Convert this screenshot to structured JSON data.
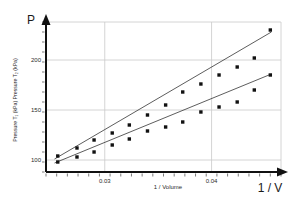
{
  "chart_data": {
    "type": "scatter",
    "title": "",
    "xlabel": "1 / Volume",
    "ylabel": "Pressure T₁ (kPa)   Pressure T₂ (kPa)",
    "axis_arrow_y_label": "P",
    "axis_arrow_x_label": "1 / V",
    "xlim": [
      0.0245,
      0.0465
    ],
    "ylim": [
      88,
      238
    ],
    "xticks": [
      0.03,
      0.04
    ],
    "xtick_labels": [
      "0.03",
      "0.04"
    ],
    "yticks": [
      100,
      150,
      200
    ],
    "ytick_labels": [
      "100",
      "150",
      "200"
    ],
    "x_minor_tick_count": 22,
    "y_minor_tick_count": 15,
    "grid": true,
    "grid_color": "#c9c9c9",
    "axis_color": "#111111",
    "marker_color": "#111111",
    "line_color": "#333333",
    "legend": "none",
    "series": [
      {
        "name": "Pressure T₂ (kPa)",
        "marker": "square",
        "x": [
          0.0256,
          0.0274,
          0.029,
          0.0307,
          0.0323,
          0.034,
          0.0357,
          0.0373,
          0.039,
          0.0407,
          0.0424,
          0.044,
          0.0455
        ],
        "values": [
          104,
          112,
          120,
          127,
          135,
          145,
          155,
          168,
          176,
          185,
          193,
          202,
          230
        ]
      },
      {
        "name": "Pressure T₁ (kPa)",
        "marker": "square",
        "x": [
          0.0256,
          0.0274,
          0.029,
          0.0307,
          0.0323,
          0.034,
          0.0357,
          0.0373,
          0.039,
          0.0407,
          0.0424,
          0.044,
          0.0455
        ],
        "values": [
          98,
          103,
          108,
          115,
          121,
          129,
          133,
          138,
          148,
          153,
          158,
          170,
          185
        ]
      }
    ],
    "trendlines": [
      {
        "name": "T₂ fit",
        "x1": 0.0253,
        "y1": 101,
        "x2": 0.0456,
        "y2": 228
      },
      {
        "name": "T₁ fit",
        "x1": 0.0253,
        "y1": 97,
        "x2": 0.0456,
        "y2": 186
      }
    ]
  }
}
